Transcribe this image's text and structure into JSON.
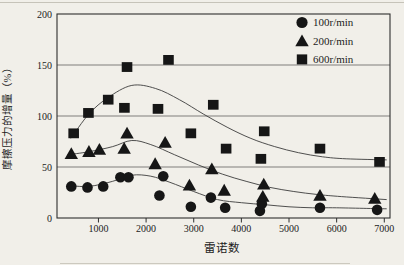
{
  "figure": {
    "background": "#f1efe9",
    "ink": "#161616",
    "frame_color": "#2e2e2e",
    "grid_color": "#4f4f4f",
    "curve_color": "#3c3c3c"
  },
  "chart_data": {
    "type": "scatter",
    "title": "",
    "xlabel": "雷诺数",
    "ylabel": "摩擦压力的增量（%）",
    "xlim": [
      130,
      7120
    ],
    "ylim": [
      0,
      200
    ],
    "xticks": [
      1000,
      2000,
      3000,
      4000,
      5000,
      6000,
      7000
    ],
    "yticks": [
      0,
      50,
      100,
      150,
      200
    ],
    "grid": "horizontal gridlines at 50, 100, 150; full rectangular frame",
    "legend_position": "top-right inside plot",
    "series": [
      {
        "name": "100r/min",
        "marker": "circle",
        "points": [
          [
            430,
            31
          ],
          [
            770,
            30
          ],
          [
            1100,
            31
          ],
          [
            1460,
            40
          ],
          [
            1630,
            40
          ],
          [
            2280,
            22
          ],
          [
            2360,
            41
          ],
          [
            2940,
            11
          ],
          [
            3360,
            20
          ],
          [
            3660,
            10
          ],
          [
            4390,
            7
          ],
          [
            4430,
            14
          ],
          [
            5650,
            10
          ],
          [
            6850,
            8
          ]
        ],
        "trend": [
          [
            350,
            32
          ],
          [
            800,
            31
          ],
          [
            1300,
            36
          ],
          [
            1700,
            42
          ],
          [
            2100,
            41
          ],
          [
            2500,
            35
          ],
          [
            3000,
            26
          ],
          [
            3500,
            18
          ],
          [
            4000,
            15
          ],
          [
            4500,
            13
          ],
          [
            5000,
            11
          ],
          [
            5500,
            10
          ],
          [
            6000,
            10
          ],
          [
            7050,
            9
          ]
        ]
      },
      {
        "name": "200r/min",
        "marker": "triangle",
        "points": [
          [
            430,
            63
          ],
          [
            800,
            65
          ],
          [
            1020,
            67
          ],
          [
            1540,
            68
          ],
          [
            1600,
            83
          ],
          [
            2190,
            53
          ],
          [
            2400,
            74
          ],
          [
            2910,
            32
          ],
          [
            3380,
            48
          ],
          [
            3640,
            27
          ],
          [
            4450,
            21
          ],
          [
            4470,
            33
          ],
          [
            5650,
            22
          ],
          [
            6800,
            19
          ]
        ],
        "trend": [
          [
            350,
            62
          ],
          [
            800,
            65
          ],
          [
            1300,
            70
          ],
          [
            1700,
            76
          ],
          [
            2100,
            72
          ],
          [
            2600,
            62
          ],
          [
            3100,
            52
          ],
          [
            3600,
            43
          ],
          [
            4100,
            36
          ],
          [
            4600,
            30
          ],
          [
            5100,
            26
          ],
          [
            5600,
            23
          ],
          [
            6100,
            21
          ],
          [
            7050,
            18
          ]
        ]
      },
      {
        "name": "600r/min",
        "marker": "square",
        "points": [
          [
            480,
            83
          ],
          [
            790,
            103
          ],
          [
            1205,
            116
          ],
          [
            1545,
            108
          ],
          [
            1600,
            148
          ],
          [
            2250,
            107
          ],
          [
            2470,
            155
          ],
          [
            2940,
            83
          ],
          [
            3410,
            111
          ],
          [
            3680,
            68
          ],
          [
            4410,
            58
          ],
          [
            4480,
            85
          ],
          [
            5650,
            68
          ],
          [
            6900,
            55
          ]
        ],
        "trend": [
          [
            420,
            78
          ],
          [
            800,
            102
          ],
          [
            1200,
            118
          ],
          [
            1700,
            130
          ],
          [
            2200,
            127
          ],
          [
            2700,
            116
          ],
          [
            3200,
            102
          ],
          [
            3700,
            89
          ],
          [
            4200,
            78
          ],
          [
            4700,
            70
          ],
          [
            5200,
            64
          ],
          [
            5700,
            60
          ],
          [
            6200,
            58
          ],
          [
            7050,
            57
          ]
        ]
      }
    ]
  }
}
